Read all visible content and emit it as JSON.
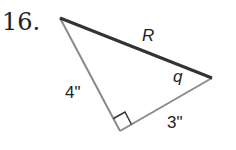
{
  "problem": {
    "number": "16.",
    "hypotenuse_label": "R",
    "angle_label": "q",
    "left_leg_label": "4\"",
    "bottom_leg_label": "3\""
  },
  "colors": {
    "hypotenuse": "#333333",
    "legs": "#8a8a8a",
    "text": "#222222"
  }
}
